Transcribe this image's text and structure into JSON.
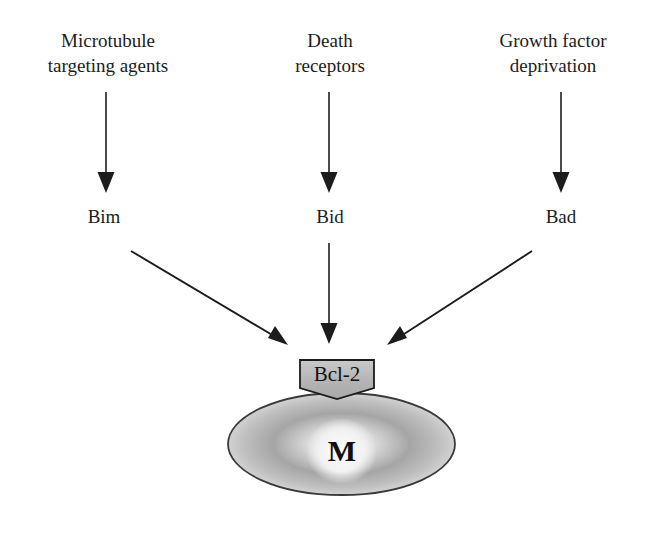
{
  "figure": {
    "type": "pathway-diagram",
    "background_color": "#ffffff",
    "ink_color": "#1c1c1c"
  },
  "stimuli": [
    {
      "label": "Microtubule\ntargeting agents"
    },
    {
      "label": "Death\nreceptors"
    },
    {
      "label": "Growth factor\ndeprivation"
    }
  ],
  "proteins": [
    {
      "label": "Bim"
    },
    {
      "label": "Bid"
    },
    {
      "label": "Bad"
    }
  ],
  "target": {
    "bcl2_label": "Bcl-2",
    "bcl2_fill": "#b9b9b9",
    "bcl2_stroke": "#1c1c1c"
  },
  "mitochondrion": {
    "label": "M",
    "fill_center": "#efefef",
    "fill_ring": "#9a9a9a",
    "fill_edge": "#e3e3e3",
    "stroke": "#3a3a3a"
  },
  "arrows": {
    "stroke": "#1c1c1c",
    "vertical": [
      {
        "name": "microtubule-to-bim",
        "x1": 106,
        "y1": 92,
        "x2": 106,
        "y2": 188
      },
      {
        "name": "death-receptors-to-bid",
        "x1": 329,
        "y1": 92,
        "x2": 329,
        "y2": 188
      },
      {
        "name": "growth-factor-to-bad",
        "x1": 561,
        "y1": 92,
        "x2": 561,
        "y2": 188
      }
    ],
    "converging": [
      {
        "name": "bim-to-bcl2",
        "x1": 131,
        "y1": 251,
        "x2": 287,
        "y2": 344
      },
      {
        "name": "bid-to-bcl2",
        "x1": 329,
        "y1": 243,
        "x2": 329,
        "y2": 339
      },
      {
        "name": "bad-to-bcl2",
        "x1": 532,
        "y1": 251,
        "x2": 388,
        "y2": 344
      }
    ]
  }
}
